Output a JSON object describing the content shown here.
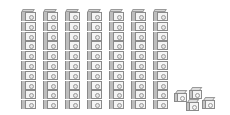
{
  "figure": {
    "tens_rods": {
      "count": 7,
      "cubes_per_rod": 10,
      "x_positions": [
        21,
        43,
        65,
        87,
        109,
        131,
        153
      ]
    },
    "ones_cubes": {
      "count": 4,
      "positions": [
        [
          174,
          90
        ],
        [
          189,
          87
        ],
        [
          186,
          99
        ],
        [
          202,
          97
        ]
      ]
    },
    "represented_value": 74,
    "colors": {
      "cube_face": "#f4f4f4",
      "cube_outline": "#8a8a8a",
      "cube_side": "#bdbdbd",
      "background": "#ffffff"
    }
  }
}
